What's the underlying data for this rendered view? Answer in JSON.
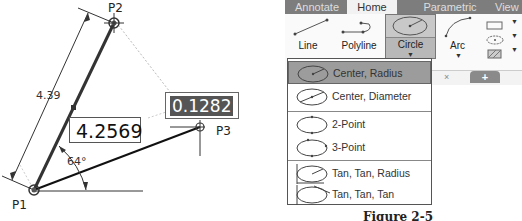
{
  "drawing": {
    "points": {
      "p1": "P1",
      "p2": "P2",
      "p3": "P3"
    },
    "dimension_length": "4.39",
    "angle_label": "64°",
    "length_input_value": "4.2569",
    "angle_input_value": "0.1282"
  },
  "ribbon": {
    "tabs": [
      {
        "label": "Annotate"
      },
      {
        "label": "Home",
        "active": true
      },
      {
        "label": "Parametric"
      },
      {
        "label": "View"
      }
    ],
    "tools": {
      "line": "Line",
      "polyline": "Polyline",
      "circle": "Circle",
      "arc": "Arc"
    }
  },
  "circle_menu": {
    "items": [
      {
        "label": "Center, Radius",
        "selected": true
      },
      {
        "label": "Center, Diameter"
      },
      {
        "label": "2-Point"
      },
      {
        "label": "3-Point"
      },
      {
        "label": "Tan, Tan, Radius"
      },
      {
        "label": "Tan, Tan, Tan"
      }
    ]
  },
  "canvas_tabs": {
    "close": "×",
    "new": "+"
  },
  "caption": "Figure 2-5"
}
